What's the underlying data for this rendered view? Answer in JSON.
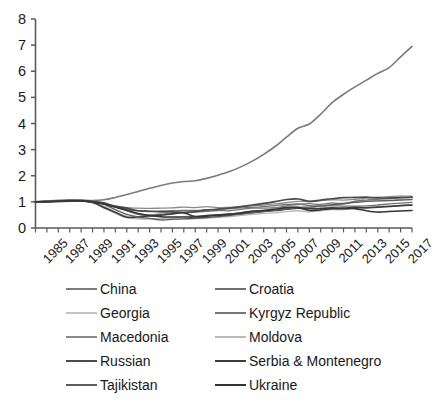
{
  "chart_data": {
    "type": "line",
    "title": "",
    "xlabel": "",
    "ylabel": "",
    "xlim": [
      1985,
      2018
    ],
    "ylim": [
      0,
      8
    ],
    "yticks": [
      0,
      1,
      2,
      3,
      4,
      5,
      6,
      7,
      8
    ],
    "grid": false,
    "legend_position": "bottom",
    "legend_columns": 2,
    "x": [
      1985,
      1986,
      1987,
      1988,
      1989,
      1990,
      1991,
      1992,
      1993,
      1994,
      1995,
      1996,
      1997,
      1998,
      1999,
      2000,
      2001,
      2002,
      2003,
      2004,
      2005,
      2006,
      2007,
      2008,
      2009,
      2010,
      2011,
      2012,
      2013,
      2014,
      2015,
      2016,
      2017,
      2018
    ],
    "xtick_labels": [
      "1985",
      "1987",
      "1989",
      "1991",
      "1993",
      "1995",
      "1997",
      "1999",
      "2001",
      "2003",
      "2005",
      "2007",
      "2009",
      "2011",
      "2013",
      "2015",
      "2017"
    ],
    "series": [
      {
        "name": "China",
        "color": "#7b7b7b",
        "width": 1.6,
        "values": [
          1.0,
          1.03,
          1.06,
          1.08,
          1.07,
          1.05,
          1.08,
          1.17,
          1.28,
          1.4,
          1.52,
          1.63,
          1.72,
          1.78,
          1.81,
          1.9,
          2.02,
          2.16,
          2.34,
          2.56,
          2.82,
          3.12,
          3.48,
          3.82,
          3.98,
          4.36,
          4.8,
          5.12,
          5.4,
          5.66,
          5.92,
          6.14,
          6.55,
          6.95
        ]
      },
      {
        "name": "Croatia",
        "color": "#6f6f6f",
        "width": 1.3,
        "values": [
          1.0,
          1.01,
          1.02,
          1.03,
          1.04,
          1.0,
          0.92,
          0.8,
          0.7,
          0.66,
          0.64,
          0.65,
          0.66,
          0.67,
          0.67,
          0.69,
          0.71,
          0.74,
          0.77,
          0.79,
          0.82,
          0.86,
          0.9,
          0.92,
          0.86,
          0.85,
          0.85,
          0.84,
          0.84,
          0.85,
          0.88,
          0.92,
          0.95,
          0.98
        ]
      },
      {
        "name": "Georgia",
        "color": "#c4c4c4",
        "width": 1.3,
        "values": [
          1.0,
          1.01,
          1.03,
          1.05,
          1.04,
          0.97,
          0.8,
          0.55,
          0.4,
          0.34,
          0.35,
          0.38,
          0.42,
          0.44,
          0.45,
          0.47,
          0.5,
          0.53,
          0.58,
          0.62,
          0.68,
          0.74,
          0.81,
          0.84,
          0.8,
          0.85,
          0.91,
          0.97,
          1.0,
          1.03,
          1.05,
          1.06,
          1.08,
          1.1
        ]
      },
      {
        "name": "Kyrgyz Republic",
        "color": "#777777",
        "width": 1.3,
        "values": [
          1.0,
          1.02,
          1.04,
          1.06,
          1.06,
          1.02,
          0.95,
          0.8,
          0.66,
          0.52,
          0.5,
          0.53,
          0.58,
          0.6,
          0.61,
          0.64,
          0.67,
          0.66,
          0.71,
          0.76,
          0.76,
          0.78,
          0.85,
          0.91,
          0.93,
          0.9,
          0.96,
          0.93,
          1.03,
          1.07,
          1.1,
          1.13,
          1.16,
          1.18
        ]
      },
      {
        "name": "Macedonia",
        "color": "#8a8a8a",
        "width": 1.3,
        "values": [
          1.0,
          1.0,
          1.01,
          1.02,
          1.03,
          0.99,
          0.92,
          0.85,
          0.78,
          0.76,
          0.75,
          0.76,
          0.77,
          0.8,
          0.78,
          0.82,
          0.78,
          0.79,
          0.81,
          0.85,
          0.88,
          0.92,
          0.97,
          1.02,
          1.01,
          1.05,
          1.08,
          1.07,
          1.1,
          1.14,
          1.18,
          1.2,
          1.22,
          1.22
        ]
      },
      {
        "name": "Moldova",
        "color": "#b9b9b9",
        "width": 1.3,
        "values": [
          1.0,
          1.02,
          1.04,
          1.06,
          1.05,
          0.98,
          0.85,
          0.6,
          0.45,
          0.36,
          0.35,
          0.36,
          0.37,
          0.36,
          0.36,
          0.38,
          0.41,
          0.44,
          0.48,
          0.52,
          0.56,
          0.58,
          0.63,
          0.66,
          0.62,
          0.66,
          0.7,
          0.7,
          0.76,
          0.79,
          0.8,
          0.83,
          0.86,
          0.88
        ]
      },
      {
        "name": "Russian",
        "color": "#4a4a4a",
        "width": 1.7,
        "values": [
          1.0,
          1.01,
          1.03,
          1.05,
          1.05,
          1.01,
          0.96,
          0.83,
          0.76,
          0.66,
          0.64,
          0.62,
          0.62,
          0.59,
          0.63,
          0.69,
          0.72,
          0.76,
          0.82,
          0.88,
          0.94,
          1.01,
          1.09,
          1.11,
          1.02,
          1.07,
          1.12,
          1.16,
          1.17,
          1.18,
          1.15,
          1.15,
          1.16,
          1.18
        ]
      },
      {
        "name": "Serbia & Montenegro",
        "color": "#3d3d3d",
        "width": 1.7,
        "values": [
          1.0,
          1.01,
          1.02,
          1.03,
          1.04,
          0.98,
          0.78,
          0.6,
          0.41,
          0.43,
          0.46,
          0.49,
          0.54,
          0.58,
          0.44,
          0.47,
          0.5,
          0.53,
          0.55,
          0.6,
          0.64,
          0.67,
          0.72,
          0.76,
          0.74,
          0.75,
          0.77,
          0.76,
          0.79,
          0.77,
          0.8,
          0.83,
          0.86,
          0.88
        ]
      },
      {
        "name": "Tajikistan",
        "color": "#5d5d5d",
        "width": 1.4,
        "values": [
          1.0,
          1.01,
          1.03,
          1.05,
          1.04,
          0.99,
          0.92,
          0.7,
          0.52,
          0.42,
          0.37,
          0.31,
          0.33,
          0.35,
          0.37,
          0.4,
          0.44,
          0.48,
          0.53,
          0.58,
          0.63,
          0.68,
          0.73,
          0.78,
          0.8,
          0.84,
          0.89,
          0.93,
          0.98,
          1.02,
          1.04,
          1.05,
          1.07,
          1.09
        ]
      },
      {
        "name": "Ukraine",
        "color": "#343434",
        "width": 1.6,
        "values": [
          1.0,
          1.01,
          1.03,
          1.04,
          1.04,
          1.0,
          0.92,
          0.8,
          0.68,
          0.55,
          0.48,
          0.43,
          0.42,
          0.42,
          0.42,
          0.45,
          0.49,
          0.52,
          0.58,
          0.65,
          0.67,
          0.72,
          0.78,
          0.79,
          0.67,
          0.7,
          0.74,
          0.74,
          0.74,
          0.66,
          0.61,
          0.63,
          0.65,
          0.67
        ]
      }
    ]
  },
  "legend": {
    "entries": [
      {
        "label": "China",
        "color": "#7b7b7b"
      },
      {
        "label": "Croatia",
        "color": "#6f6f6f"
      },
      {
        "label": "Georgia",
        "color": "#c4c4c4"
      },
      {
        "label": "Kyrgyz Republic",
        "color": "#777777"
      },
      {
        "label": "Macedonia",
        "color": "#8a8a8a"
      },
      {
        "label": "Moldova",
        "color": "#b9b9b9"
      },
      {
        "label": "Russian",
        "color": "#4a4a4a"
      },
      {
        "label": "Serbia & Montenegro",
        "color": "#3d3d3d"
      },
      {
        "label": "Tajikistan",
        "color": "#5d5d5d"
      },
      {
        "label": "Ukraine",
        "color": "#343434"
      }
    ]
  },
  "axis": {
    "line_color": "#595959",
    "y_max_label": "8",
    "y_min_label": "0"
  }
}
